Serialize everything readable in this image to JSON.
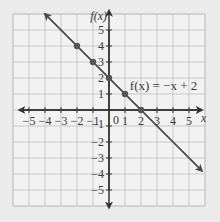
{
  "chart_data": {
    "type": "line",
    "title": "",
    "xlabel": "x",
    "ylabel": "f(x)",
    "xlim": [
      -6,
      6
    ],
    "ylim": [
      -6,
      6
    ],
    "grid": true,
    "x_ticks": [
      -5,
      -4,
      -3,
      -2,
      -1,
      1,
      2,
      3,
      4,
      5
    ],
    "y_ticks": [
      -5,
      -4,
      -3,
      -2,
      -1,
      1,
      2,
      3,
      4,
      5
    ],
    "x_tick_labels": [
      "−5",
      "−4",
      "−3",
      "−2",
      "−1",
      "1",
      "2",
      "3",
      "4",
      "5"
    ],
    "y_tick_labels": [
      "−5",
      "−4",
      "−3",
      "−2",
      "−1",
      "1",
      "2",
      "3",
      "4",
      "5"
    ],
    "origin_label": "0",
    "series": [
      {
        "name": "f(x) = −x + 2",
        "equation": "f(x) = −x + 2",
        "slope": -1,
        "intercept": 2,
        "line_from": [
          -4,
          6
        ],
        "line_to": [
          5.8,
          -3.8
        ],
        "points": [
          {
            "x": -2,
            "y": 4
          },
          {
            "x": -1,
            "y": 3
          },
          {
            "x": 0,
            "y": 2
          },
          {
            "x": 1,
            "y": 1
          },
          {
            "x": 2,
            "y": 0
          }
        ]
      }
    ],
    "annotations": [
      {
        "text": "f(x) = −x + 2",
        "x": 1.3,
        "y": 1.5
      }
    ]
  },
  "labels": {
    "x_axis": "x",
    "y_axis": "f(x)",
    "origin": "0",
    "function": "f(x) = −x + 2"
  },
  "colors": {
    "background": "#ebebeb",
    "grid_bg": "#f2f2f2",
    "grid_line": "#c8c8c8",
    "axis": "#333333",
    "line": "#4a4a4a",
    "point": "#555555"
  }
}
